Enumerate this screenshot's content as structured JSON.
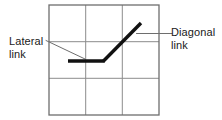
{
  "figure": {
    "title": "",
    "background_color": "#ffffff",
    "grid": {
      "rows": 3,
      "columns": 3,
      "x": 49,
      "y": 5,
      "width": 110,
      "height": 110,
      "cell_width": 36.67,
      "cell_height": 36.33,
      "line_color": "#8c8c8c",
      "line_width": 1,
      "border_color": "#6e6e6e",
      "border_width": 1.2
    },
    "links": {
      "color": "#111111",
      "width": 3.2,
      "lateral": {
        "label": "Lateral link",
        "label_line1": "Lateral",
        "label_line2": "link",
        "x1": 68,
        "y1": 61,
        "x2": 104,
        "y2": 61
      },
      "diagonal": {
        "label": "Diagonal link",
        "label_line1": "Diagonal",
        "label_line2": "link",
        "x1": 104,
        "y1": 61,
        "x2": 141,
        "y2": 23
      }
    },
    "leaders": {
      "color": "#6e6e6e",
      "width": 1,
      "lateral_leader": {
        "x1": 46,
        "y1": 41,
        "x2": 85,
        "y2": 59
      },
      "diagonal_leader": {
        "x1": 137,
        "y1": 33,
        "x2": 171,
        "y2": 33
      }
    }
  }
}
